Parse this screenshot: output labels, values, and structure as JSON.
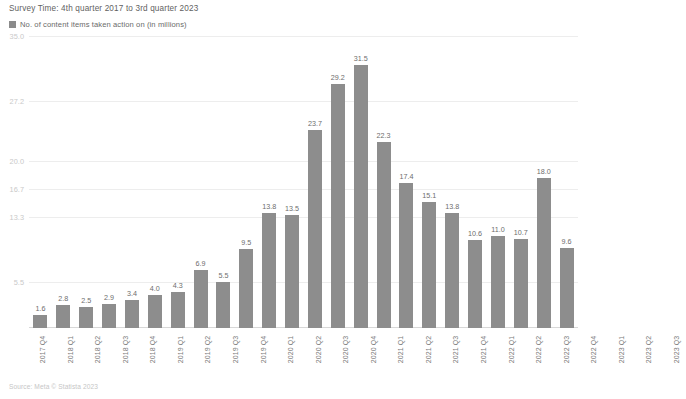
{
  "header": {
    "survey_time": "Survey Time: 4th quarter 2017 to 3rd quarter 2023"
  },
  "legend": {
    "entries": [
      {
        "label": "No. of content items taken action on (in millions)",
        "color": "#8b8b8b"
      }
    ]
  },
  "footer": {
    "source": "Source: Meta © Statista 2023"
  },
  "colors": {
    "bar": "#8d8d8d",
    "gridline": "#ededed",
    "axis": "#d8d8d8",
    "value_label": "#6d6d6d",
    "tick_label": "#c9c9c9"
  },
  "chart_data": {
    "type": "bar",
    "title": "",
    "subtitle": "Survey Time: 4th quarter 2017 to 3rd quarter 2023",
    "xlabel": "",
    "ylabel": "No. of content items taken action on (in millions)",
    "ylim": [
      0,
      35.0
    ],
    "grid": true,
    "legend_position": "top-left",
    "ytick_labels": [
      "35.0",
      "27.2",
      "20.0",
      "16.7",
      "13.3",
      "5.5"
    ],
    "ytick_values": [
      35.0,
      27.2,
      20.0,
      16.7,
      13.3,
      5.5
    ],
    "categories": [
      "2017 Q4",
      "2018 Q1",
      "2018 Q2",
      "2018 Q3",
      "2018 Q4",
      "2019 Q1",
      "2019 Q2",
      "2019 Q3",
      "2019 Q4",
      "2020 Q1",
      "2020 Q2",
      "2020 Q3",
      "2020 Q4",
      "2021 Q1",
      "2021 Q2",
      "2021 Q3",
      "2021 Q4",
      "2022 Q1",
      "2022 Q2",
      "2022 Q3",
      "2022 Q4",
      "2023 Q1",
      "2023 Q2",
      "2023 Q3"
    ],
    "series": [
      {
        "name": "No. of content items taken action on (in millions)",
        "values": [
          1.6,
          2.8,
          2.5,
          2.9,
          3.4,
          4.0,
          4.3,
          6.9,
          5.5,
          9.5,
          13.8,
          13.5,
          23.7,
          29.2,
          31.5,
          22.3,
          17.4,
          15.1,
          13.8,
          10.6,
          11.0,
          10.7,
          18.0,
          9.6
        ],
        "value_labels": [
          "1.6",
          "2.8",
          "2.5",
          "2.9",
          "3.4",
          "4.0",
          "4.3",
          "6.9",
          "5.5",
          "9.5",
          "13.8",
          "13.5",
          "23.7",
          "29.2",
          "31.5",
          "22.3",
          "17.4",
          "15.1",
          "13.8",
          "10.6",
          "11.0",
          "10.7",
          "18.0",
          "9.6"
        ]
      }
    ]
  }
}
